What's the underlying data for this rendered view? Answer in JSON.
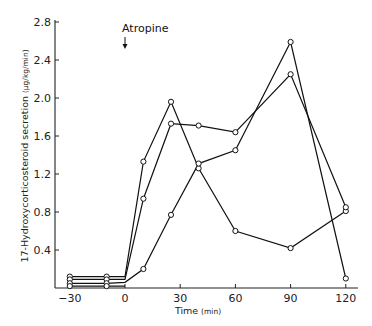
{
  "chart_data": {
    "type": "line",
    "title": "",
    "xlabel": "Time (min)",
    "ylabel": "17-Hydroxycorticosteroid secretion (µg/kg/min)",
    "xlim": [
      -35,
      125
    ],
    "ylim": [
      0,
      2.8
    ],
    "xticks": [
      -30,
      0,
      30,
      60,
      90,
      120
    ],
    "yticks": [
      0.4,
      0.8,
      1.2,
      1.6,
      2.0,
      2.4,
      2.8
    ],
    "xtick_labels": [
      "−30",
      "0",
      "30",
      "60",
      "90",
      "120"
    ],
    "ytick_labels": [
      "0.4",
      "0.8",
      "1.2",
      "1.6",
      "2.0",
      "2.4",
      "2.8"
    ],
    "grid": false,
    "legend": null,
    "annotations": [
      {
        "text": "Atropine",
        "x": 0,
        "arrow": true
      }
    ],
    "series": [
      {
        "name": "Animal 1",
        "x": [
          -30,
          -10,
          0,
          10,
          25,
          40,
          60,
          90,
          120
        ],
        "values": [
          0.12,
          0.12,
          0.12,
          1.33,
          1.96,
          1.26,
          0.6,
          0.42,
          0.81
        ]
      },
      {
        "name": "Animal 2",
        "x": [
          -30,
          -10,
          0,
          10,
          25,
          40,
          60,
          90,
          120
        ],
        "values": [
          0.09,
          0.09,
          0.09,
          0.94,
          1.73,
          1.71,
          1.64,
          2.25,
          0.85
        ]
      },
      {
        "name": "Animal 3",
        "x": [
          -30,
          -10,
          0,
          10,
          25,
          40,
          60,
          90,
          120
        ],
        "values": [
          0.05,
          0.05,
          0.06,
          0.2,
          0.77,
          1.31,
          1.45,
          2.59,
          0.1
        ]
      },
      {
        "name": "Animal 4",
        "x": [
          -30,
          -10,
          0
        ],
        "values": [
          0.02,
          0.02,
          0.02
        ]
      }
    ]
  },
  "labels": {
    "annotation": "Atropine",
    "xaxis_title": "Time",
    "xaxis_unit": "(min)",
    "yaxis_title": "17-Hydroxycorticosteroid secretion",
    "yaxis_unit": "(µg/kg/min)"
  }
}
